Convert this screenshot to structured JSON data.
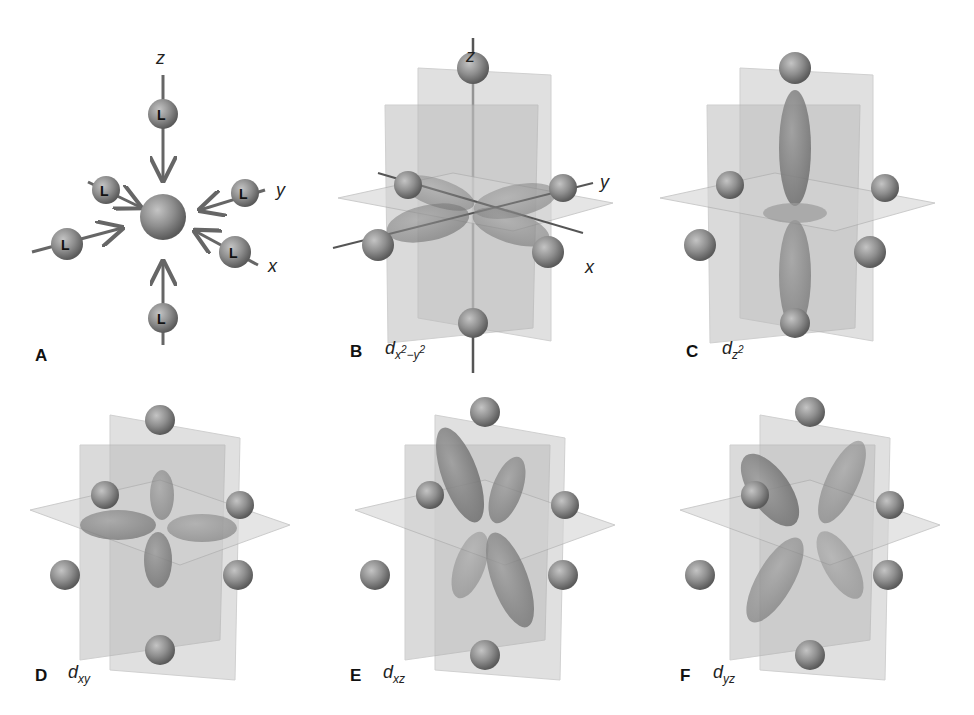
{
  "figure": {
    "panels": [
      {
        "id": "A",
        "letter": "A",
        "orbital": "",
        "description": "Octahedral approach of six ligands L toward central metal ion"
      },
      {
        "id": "B",
        "letter": "B",
        "orbital_base": "d",
        "orbital_sub": "x",
        "orbital_sup1": "2",
        "orbital_minus": "−y",
        "orbital_sup2": "2",
        "description": "d x2-y2 orbital, lobes along x and y axes pointing at ligands"
      },
      {
        "id": "C",
        "letter": "C",
        "orbital_base": "d",
        "orbital_sub": "z",
        "orbital_sup": "2",
        "description": "d z2 orbital, lobes along z axis with torus in xy plane"
      },
      {
        "id": "D",
        "letter": "D",
        "orbital_base": "d",
        "orbital_sub": "xy",
        "description": "d xy orbital, lobes between x and y axes"
      },
      {
        "id": "E",
        "letter": "E",
        "orbital_base": "d",
        "orbital_sub": "xz",
        "description": "d xz orbital, lobes between x and z axes"
      },
      {
        "id": "F",
        "letter": "F",
        "orbital_base": "d",
        "orbital_sub": "yz",
        "description": "d yz orbital, lobes between y and z axes"
      }
    ],
    "axes": {
      "x": "x",
      "y": "y",
      "z": "z"
    },
    "ligand_label": "L",
    "colors": {
      "sphere": "#8a8a8a",
      "plane": "#c8c8c8",
      "lobe": "#7a7a7a",
      "axis": "#555555",
      "text": "#111111"
    }
  }
}
